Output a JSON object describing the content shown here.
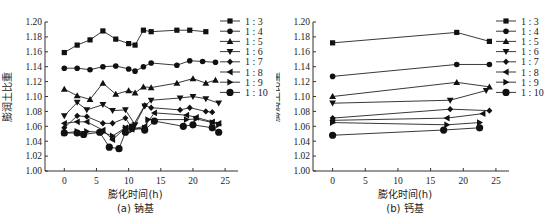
{
  "chart_data": [
    {
      "type": "line",
      "panel": "a",
      "title": "(a) 钠基",
      "xlabel": "膨化时间(h)",
      "ylabel": "膨润土比重",
      "xlim": [
        -3,
        27
      ],
      "ylim": [
        1.0,
        1.2
      ],
      "xticks": [
        0,
        5,
        10,
        15,
        20,
        25
      ],
      "yticks": [
        1.0,
        1.02,
        1.04,
        1.06,
        1.08,
        1.1,
        1.12,
        1.14,
        1.16,
        1.18,
        1.2
      ],
      "grid": false,
      "legend_position": "right",
      "series": [
        {
          "name": "1 : 3",
          "marker": "square",
          "x": [
            0,
            2,
            4,
            6,
            8,
            10,
            11,
            12.3,
            13.5,
            17.5,
            19.5,
            22
          ],
          "y": [
            1.159,
            1.169,
            1.176,
            1.188,
            1.177,
            1.171,
            1.169,
            1.189,
            1.187,
            1.189,
            1.189,
            1.187
          ]
        },
        {
          "name": "1 : 4",
          "marker": "circle-small",
          "x": [
            0,
            2,
            4,
            6,
            8,
            10,
            11,
            12.3,
            13.5,
            17.5,
            19.5,
            21.5,
            23.5
          ],
          "y": [
            1.138,
            1.138,
            1.136,
            1.14,
            1.141,
            1.137,
            1.134,
            1.14,
            1.145,
            1.142,
            1.148,
            1.147,
            1.146
          ]
        },
        {
          "name": "1 : 5",
          "marker": "triangle-up",
          "x": [
            0,
            2,
            4,
            6,
            8,
            10,
            11,
            12.3,
            13.5,
            17.5,
            20,
            22,
            23.5
          ],
          "y": [
            1.11,
            1.101,
            1.096,
            1.118,
            1.103,
            1.108,
            1.105,
            1.113,
            1.112,
            1.118,
            1.124,
            1.118,
            1.122
          ]
        },
        {
          "name": "1 : 6",
          "marker": "triangle-down",
          "x": [
            0,
            2,
            3.5,
            6,
            7.5,
            9.5,
            11,
            12.5,
            13.5,
            18,
            20,
            22,
            24
          ],
          "y": [
            1.074,
            1.092,
            1.082,
            1.089,
            1.081,
            1.082,
            1.062,
            1.087,
            1.095,
            1.098,
            1.1,
            1.097,
            1.091
          ]
        },
        {
          "name": "1 : 7",
          "marker": "diamond",
          "x": [
            0,
            2,
            3.5,
            6,
            7.5,
            9.5,
            10.5,
            12.5,
            13.5,
            18,
            19.5,
            22,
            23
          ],
          "y": [
            1.058,
            1.074,
            1.073,
            1.064,
            1.064,
            1.071,
            1.058,
            1.088,
            1.085,
            1.082,
            1.085,
            1.08,
            1.079
          ]
        },
        {
          "name": "1 : 8",
          "marker": "triangle-left",
          "x": [
            0,
            2,
            3.5,
            6,
            7.5,
            9.5,
            10.5,
            12.5,
            14,
            19,
            20.5,
            23,
            24
          ],
          "y": [
            1.064,
            1.066,
            1.066,
            1.055,
            1.042,
            1.058,
            1.056,
            1.06,
            1.078,
            1.075,
            1.072,
            1.066,
            1.064
          ]
        },
        {
          "name": "1 : 9",
          "marker": "triangle-right",
          "x": [
            0,
            2,
            3.5,
            6,
            7.5,
            9.5,
            10.5,
            12.5,
            13,
            19,
            20.5,
            23,
            24
          ],
          "y": [
            1.051,
            1.053,
            1.053,
            1.052,
            1.047,
            1.058,
            1.055,
            1.058,
            1.069,
            1.069,
            1.07,
            1.065,
            1.062
          ]
        },
        {
          "name": "1 : 10",
          "marker": "circle-large",
          "x": [
            0,
            2,
            3,
            5.5,
            7,
            8.5,
            9.5,
            10.5,
            12.5,
            14,
            18.5,
            20,
            23,
            24
          ],
          "y": [
            1.051,
            1.051,
            1.049,
            1.052,
            1.032,
            1.03,
            1.052,
            1.059,
            1.055,
            1.067,
            1.06,
            1.062,
            1.058,
            1.052
          ]
        }
      ]
    },
    {
      "type": "line",
      "panel": "b",
      "title": "(b) 钙基",
      "xlabel": "膨化时间(h)",
      "ylabel": "膨润土比重",
      "xlim": [
        -3,
        27
      ],
      "ylim": [
        1.0,
        1.2
      ],
      "xticks": [
        0,
        5,
        10,
        15,
        20,
        25
      ],
      "yticks": [
        1.0,
        1.02,
        1.04,
        1.06,
        1.08,
        1.1,
        1.12,
        1.14,
        1.16,
        1.18,
        1.2
      ],
      "grid": false,
      "legend_position": "right",
      "series": [
        {
          "name": "1 : 3",
          "marker": "square",
          "x": [
            0,
            19,
            24
          ],
          "y": [
            1.172,
            1.186,
            1.174
          ]
        },
        {
          "name": "1 : 4",
          "marker": "circle-small",
          "x": [
            0,
            19,
            24
          ],
          "y": [
            1.127,
            1.143,
            1.143
          ]
        },
        {
          "name": "1 : 5",
          "marker": "triangle-up",
          "x": [
            0,
            19,
            24
          ],
          "y": [
            1.1,
            1.119,
            1.113
          ]
        },
        {
          "name": "1 : 6",
          "marker": "triangle-down",
          "x": [
            0,
            18,
            23.5
          ],
          "y": [
            1.091,
            1.095,
            1.108
          ]
        },
        {
          "name": "1 : 7",
          "marker": "diamond",
          "x": [
            0,
            18,
            24
          ],
          "y": [
            1.071,
            1.083,
            1.081
          ]
        },
        {
          "name": "1 : 8",
          "marker": "triangle-left",
          "x": [
            0,
            17.5,
            23
          ],
          "y": [
            1.068,
            1.071,
            1.077
          ]
        },
        {
          "name": "1 : 9",
          "marker": "triangle-right",
          "x": [
            0,
            17.5,
            22.5
          ],
          "y": [
            1.065,
            1.062,
            1.065
          ]
        },
        {
          "name": "1 : 10",
          "marker": "circle-large",
          "x": [
            0,
            17,
            22.5
          ],
          "y": [
            1.048,
            1.055,
            1.058
          ]
        }
      ]
    }
  ]
}
